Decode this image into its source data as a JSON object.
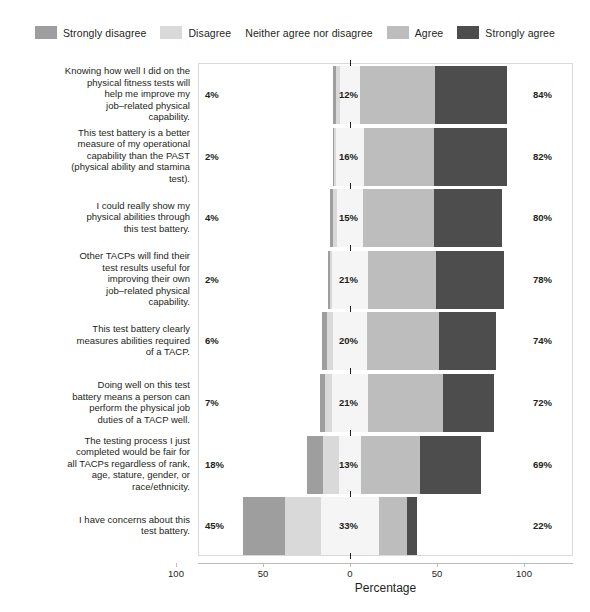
{
  "chart_data": {
    "type": "bar",
    "subtype": "diverging-stacked-likert",
    "title": "",
    "xlabel": "Percentage",
    "ylabel": "",
    "xlim": [
      -100,
      100
    ],
    "xticks": [
      -100,
      -50,
      0,
      50,
      100
    ],
    "xticklabels": [
      "100",
      "50",
      "0",
      "50",
      "100"
    ],
    "grid": false,
    "legend_position": "top",
    "legend": [
      {
        "label": "Strongly disagree",
        "color": "#9e9e9e"
      },
      {
        "label": "Disagree",
        "color": "#d9d9d9"
      },
      {
        "label": "Neither agree nor disagree",
        "color": "#f5f5f5"
      },
      {
        "label": "Agree",
        "color": "#bdbdbd"
      },
      {
        "label": "Strongly agree",
        "color": "#4d4d4d"
      }
    ],
    "categories": [
      "Knowing how well I did on the physical fitness tests will help me improve my job–related physical capability.",
      "This test battery is a better measure of my operational capability than the PAST (physical ability and stamina test).",
      "I could really show my physical abilities through this test battery.",
      "Other TACPs will find their test results useful for improving their own job–related physical capability.",
      "This test battery clearly measures abilities required of a TACP.",
      "Doing well on this test battery means a person can perform the physical job duties of a TACP well.",
      "The testing process I just completed would be fair for all TACPs regardless of rank, age, stature, gender, or race/ethnicity.",
      "I have concerns about this test battery."
    ],
    "series": [
      {
        "name": "Strongly disagree",
        "values": [
          2,
          1,
          2,
          1,
          3,
          3,
          9,
          24
        ]
      },
      {
        "name": "Disagree",
        "values": [
          2,
          1,
          2,
          1,
          3,
          4,
          9,
          21
        ]
      },
      {
        "name": "Neither agree nor disagree",
        "values": [
          12,
          16,
          15,
          21,
          20,
          21,
          13,
          33
        ]
      },
      {
        "name": "Agree",
        "values": [
          43,
          40,
          41,
          39,
          41,
          43,
          34,
          16
        ]
      },
      {
        "name": "Strongly agree",
        "values": [
          41,
          42,
          39,
          39,
          33,
          29,
          35,
          6
        ]
      }
    ],
    "rows": [
      {
        "label_lines": [
          "Knowing how well I did on the",
          "physical fitness tests will",
          "help me improve my",
          "job–related physical",
          "capability."
        ],
        "left_pct": "4%",
        "center_pct": "12%",
        "right_pct": "84%",
        "strongly_disagree": 2,
        "disagree": 2,
        "neither": 12,
        "agree": 43,
        "strongly_agree": 41
      },
      {
        "label_lines": [
          "This test battery is a better",
          "measure of my operational",
          "capability than the PAST",
          "(physical ability and stamina",
          "test)."
        ],
        "left_pct": "2%",
        "center_pct": "16%",
        "right_pct": "82%",
        "strongly_disagree": 1,
        "disagree": 1,
        "neither": 16,
        "agree": 40,
        "strongly_agree": 42
      },
      {
        "label_lines": [
          "I could really show my",
          "physical abilities through",
          "this test battery."
        ],
        "left_pct": "4%",
        "center_pct": "15%",
        "right_pct": "80%",
        "strongly_disagree": 2,
        "disagree": 2,
        "neither": 15,
        "agree": 41,
        "strongly_agree": 39
      },
      {
        "label_lines": [
          "Other TACPs will find their",
          "test results useful for",
          "improving their own",
          "job–related physical",
          "capability."
        ],
        "left_pct": "2%",
        "center_pct": "21%",
        "right_pct": "78%",
        "strongly_disagree": 1,
        "disagree": 1,
        "neither": 21,
        "agree": 39,
        "strongly_agree": 39
      },
      {
        "label_lines": [
          "This test battery clearly",
          "measures abilities required",
          "of a TACP."
        ],
        "left_pct": "6%",
        "center_pct": "20%",
        "right_pct": "74%",
        "strongly_disagree": 3,
        "disagree": 3,
        "neither": 20,
        "agree": 41,
        "strongly_agree": 33
      },
      {
        "label_lines": [
          "Doing well on this test",
          "battery means a person can",
          "perform the physical job",
          "duties of a TACP well."
        ],
        "left_pct": "7%",
        "center_pct": "21%",
        "right_pct": "72%",
        "strongly_disagree": 3,
        "disagree": 4,
        "neither": 21,
        "agree": 43,
        "strongly_agree": 29
      },
      {
        "label_lines": [
          "The testing process I just",
          "completed would be fair for",
          "all TACPs regardless of rank,",
          "age, stature, gender, or",
          "race/ethnicity."
        ],
        "left_pct": "18%",
        "center_pct": "13%",
        "right_pct": "69%",
        "strongly_disagree": 9,
        "disagree": 9,
        "neither": 13,
        "agree": 34,
        "strongly_agree": 35
      },
      {
        "label_lines": [
          "I have concerns about this",
          "test battery."
        ],
        "left_pct": "45%",
        "center_pct": "33%",
        "right_pct": "22%",
        "strongly_disagree": 24,
        "disagree": 21,
        "neither": 33,
        "agree": 16,
        "strongly_agree": 6
      }
    ]
  }
}
